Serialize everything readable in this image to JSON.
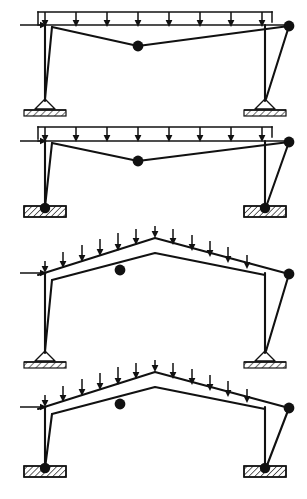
{
  "figure": {
    "panel_count": 4,
    "stroke_color": "#111111",
    "background_color": "#ffffff"
  },
  "panels": [
    {
      "id": "panel-1",
      "index": 1,
      "label": "Flat-roof portal frame, sagging tie, pin supports on hatched ground",
      "roof_type": "flat-rail-sagging-tie",
      "support_type": "triangular-pin-on-hatched-ground",
      "hinge_count": 2,
      "vertical_load": {
        "name": "uniformly-distributed-load",
        "arrow_count": 8,
        "direction": "downward",
        "rail": "horizontal"
      },
      "horizontal_load": {
        "name": "lateral-point-load",
        "direction": "rightward",
        "location": "left-eaves"
      },
      "hinges": [
        {
          "name": "mid-span-hinge",
          "position": "mid-span-low-point"
        },
        {
          "name": "right-eaves-hinge",
          "position": "right-eaves-outboard"
        }
      ]
    },
    {
      "id": "panel-2",
      "index": 2,
      "label": "Flat-roof portal frame, sagging tie, pinned bases in hatched footing",
      "roof_type": "flat-rail-sagging-tie",
      "support_type": "pin-dot-in-hatched-footing",
      "hinge_count": 2,
      "vertical_load": {
        "name": "uniformly-distributed-load",
        "arrow_count": 8,
        "direction": "downward",
        "rail": "horizontal"
      },
      "horizontal_load": {
        "name": "lateral-point-load",
        "direction": "rightward",
        "location": "left-eaves"
      },
      "hinges": [
        {
          "name": "mid-span-hinge",
          "position": "mid-span-low-point"
        },
        {
          "name": "right-eaves-hinge",
          "position": "right-eaves-outboard"
        }
      ]
    },
    {
      "id": "panel-3",
      "index": 3,
      "label": "Gabled pitched-roof portal frame, pin supports on hatched ground",
      "roof_type": "gabled-pitched",
      "support_type": "triangular-pin-on-hatched-ground",
      "hinge_count": 2,
      "vertical_load": {
        "name": "uniformly-distributed-load",
        "arrow_count": 12,
        "direction": "downward",
        "rail": "follows-roof-slope"
      },
      "horizontal_load": {
        "name": "lateral-point-load",
        "direction": "rightward",
        "location": "left-eaves"
      },
      "hinges": [
        {
          "name": "left-chord-hinge",
          "position": "left-inner-chord"
        },
        {
          "name": "right-eaves-hinge",
          "position": "right-eaves-outboard"
        }
      ]
    },
    {
      "id": "panel-4",
      "index": 4,
      "label": "Gabled pitched-roof portal frame, pinned bases in hatched footing",
      "roof_type": "gabled-pitched",
      "support_type": "pin-dot-in-hatched-footing",
      "hinge_count": 2,
      "vertical_load": {
        "name": "uniformly-distributed-load",
        "arrow_count": 12,
        "direction": "downward",
        "rail": "follows-roof-slope"
      },
      "horizontal_load": {
        "name": "lateral-point-load",
        "direction": "rightward",
        "location": "left-eaves"
      },
      "hinges": [
        {
          "name": "left-chord-hinge",
          "position": "left-inner-chord"
        },
        {
          "name": "right-eaves-hinge",
          "position": "right-eaves-outboard"
        }
      ]
    }
  ],
  "geometry": {
    "panel_1": {
      "rail_y": 12,
      "beam_y": 25,
      "left_col_x": 45,
      "right_col_x": 265,
      "rail_left": 38,
      "rail_right": 272,
      "arrow_xs": [
        45,
        76,
        107,
        138,
        169,
        200,
        231,
        262
      ],
      "beam_left_x": 52,
      "beam_apex_x": 138,
      "beam_apex_y": 46,
      "hinge_right_x": 289,
      "hinge_right_y": 26,
      "base_y": 101,
      "lat_arrow_y": 25,
      "lat_arrow_x0": 20,
      "brace_left_top_x": 52,
      "brace_left_bot_x": 45,
      "brace_right_top_x": 289,
      "brace_right_bot_x": 265
    },
    "panel_2": {
      "rail_y": 127,
      "beam_y": 141,
      "left_col_x": 45,
      "right_col_x": 265,
      "rail_left": 38,
      "rail_right": 272,
      "arrow_xs": [
        45,
        76,
        107,
        138,
        169,
        200,
        231,
        262
      ],
      "beam_left_x": 52,
      "beam_apex_x": 138,
      "beam_apex_y": 161,
      "hinge_right_x": 289,
      "hinge_right_y": 142,
      "base_y": 212,
      "lat_arrow_y": 141,
      "lat_arrow_x0": 20
    },
    "panel_3": {
      "eaves_y": 273,
      "apex_x": 155,
      "apex_y": 238,
      "left_col_x": 45,
      "right_col_x": 265,
      "chord_left_x": 52,
      "chord_left_y": 280,
      "chord_apex_y": 253,
      "hinge_left_x": 120,
      "hinge_left_y": 270,
      "hinge_right_x": 289,
      "hinge_right_y": 274,
      "base_y": 355,
      "lat_arrow_y": 273,
      "lat_arrow_x0": 20
    },
    "panel_4": {
      "eaves_y": 407,
      "apex_x": 155,
      "apex_y": 372,
      "left_col_x": 45,
      "right_col_x": 265,
      "chord_left_x": 52,
      "chord_left_y": 414,
      "chord_apex_y": 387,
      "hinge_left_x": 120,
      "hinge_left_y": 404,
      "hinge_right_x": 289,
      "hinge_right_y": 408,
      "base_y": 472,
      "lat_arrow_y": 407,
      "lat_arrow_x0": 20
    }
  }
}
